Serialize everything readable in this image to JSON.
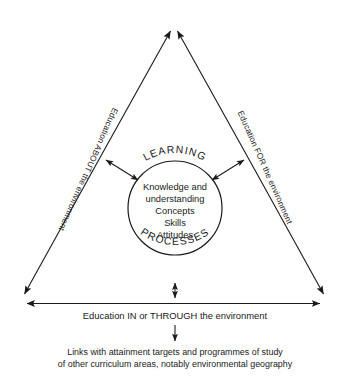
{
  "diagram": {
    "colors": {
      "ink": "#1a1a1a",
      "background": "#ffffff"
    },
    "sides": {
      "left_label": "Education ABOUT the environment",
      "right_label": "Education FOR the environment",
      "base_label": "Education IN or THROUGH the environment"
    },
    "circle": {
      "top_arc_label": "LEARNING",
      "bottom_arc_label": "PROCESSES",
      "core_lines": [
        "Knowledge and",
        "understanding",
        "Concepts",
        "Skills",
        "Attitudes"
      ]
    },
    "footnote": {
      "line1": "Links with attainment targets and programmes of study",
      "line2": "of other curriculum areas, notably environmental geography"
    },
    "icons": {
      "apex_left_arrowhead": "arrow-up-left-icon",
      "apex_right_arrowhead": "arrow-up-right-icon",
      "base_left_arrowhead": "arrow-left-icon",
      "base_right_arrowhead": "arrow-right-icon",
      "circle_left_connector": "double-arrow-icon",
      "circle_right_connector": "double-arrow-icon",
      "processes_connector": "double-arrow-vertical-icon",
      "footnote_connector": "arrow-down-icon"
    }
  }
}
